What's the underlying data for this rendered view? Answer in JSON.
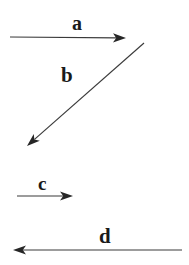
{
  "figure": {
    "background_color": "#ffffff",
    "stroke_color": "#3a3a3a",
    "label_color": "#1a1a1a",
    "width": 189,
    "height": 265
  },
  "chart_data": {
    "type": "diagram",
    "subtype": "vector-arrow-diagram",
    "title": "",
    "xlabel": "",
    "ylabel": "",
    "grid": false,
    "legend": null,
    "coordinate_note": "pixel coordinates, origin top-left, y increases downward",
    "vectors": [
      {
        "label": "a",
        "direction": "right",
        "orientation": "horizontal",
        "tail": [
          10,
          37
        ],
        "tip": [
          126,
          38
        ],
        "length_px": 116,
        "angle_deg": 0,
        "arrowhead_at": "tip",
        "label_position": [
          77,
          23
        ]
      },
      {
        "label": "b",
        "direction": "down-left",
        "orientation": "diagonal",
        "tail": [
          144,
          43
        ],
        "tip": [
          27,
          146
        ],
        "length_px": 156,
        "angle_deg": 221,
        "arrowhead_at": "tip",
        "label_position": [
          67,
          75
        ]
      },
      {
        "label": "c",
        "direction": "right",
        "orientation": "horizontal",
        "tail": [
          17,
          196
        ],
        "tip": [
          73,
          196
        ],
        "length_px": 56,
        "angle_deg": 0,
        "arrowhead_at": "tip",
        "label_position": [
          42,
          183
        ]
      },
      {
        "label": "d",
        "direction": "left",
        "orientation": "horizontal",
        "tail": [
          182,
          250
        ],
        "tip": [
          13,
          250
        ],
        "length_px": 169,
        "angle_deg": 180,
        "arrowhead_at": "tip",
        "label_position": [
          105,
          236
        ]
      }
    ],
    "labels": [
      "a",
      "b",
      "c",
      "d"
    ]
  },
  "labels": {
    "a": "a",
    "b": "b",
    "c": "c",
    "d": "d"
  }
}
